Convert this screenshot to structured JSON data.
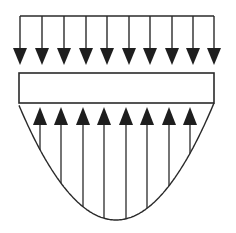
{
  "diagram": {
    "title": "",
    "colors": {
      "stroke": "#2a2a2a",
      "fill": "#1e1e1e",
      "background": "#ffffff"
    },
    "top_load": {
      "type": "uniform",
      "arrow_count": 10,
      "arrow_x": [
        20,
        42,
        64,
        86,
        107,
        129,
        150,
        172,
        193,
        214
      ],
      "line_y": 16,
      "tip_y": 65
    },
    "beam": {
      "x": 19,
      "y": 73,
      "width": 195,
      "height": 30
    },
    "reaction": {
      "type": "parabolic",
      "arrow_count": 8,
      "arrow_x": [
        40,
        61,
        83,
        104,
        126,
        147,
        169,
        190
      ],
      "base_y": 103,
      "vertex": [
        116,
        220
      ],
      "ends": [
        19,
        214
      ]
    }
  }
}
